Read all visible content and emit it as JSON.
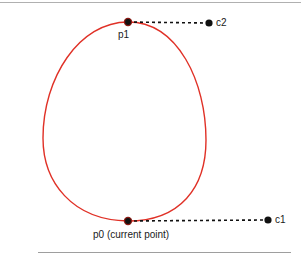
{
  "figure": {
    "background_color": "#ffffff",
    "width": 301,
    "height": 264,
    "rules": {
      "top_rule_color": "#b0b0b0",
      "bottom_rule_color": "#9e9e9e"
    },
    "curve": {
      "name": "closed-bezier-loop",
      "stroke_color": "#e03127",
      "stroke_width": 1.4,
      "fill": "none",
      "path": "M 128 221 C 72 220 43 182 43 138 C 43 78 79 22 128 22 C 178 22 206 82 206 140 C 206 188 180 221 128 221 Z"
    },
    "dashed_lines": {
      "stroke_color": "#111111",
      "stroke_width": 1.6,
      "dash_pattern": "3 3",
      "segments": [
        {
          "name": "p0-to-c1",
          "x1": 128,
          "y1": 221,
          "x2": 266,
          "y2": 220
        },
        {
          "name": "p1-to-c2",
          "x1": 128,
          "y1": 22,
          "x2": 207,
          "y2": 23
        }
      ]
    },
    "points": [
      {
        "id": "p0",
        "label": "p0 (current point)",
        "x": 128,
        "y": 221,
        "color": "#111111",
        "halo_color": "#8a1a14",
        "radius": 3.6
      },
      {
        "id": "p1",
        "label": "p1",
        "x": 128,
        "y": 22,
        "color": "#111111",
        "halo_color": "#8a1a14",
        "radius": 3.6
      },
      {
        "id": "c1",
        "label": "c1",
        "x": 268,
        "y": 220,
        "color": "#111111",
        "halo_color": "#111111",
        "radius": 3.4
      },
      {
        "id": "c2",
        "label": "c2",
        "x": 209,
        "y": 23,
        "color": "#111111",
        "halo_color": "#111111",
        "radius": 3.4
      }
    ],
    "labels": {
      "p0": "p0 (current point)",
      "p1": "p1",
      "c1": "c1",
      "c2": "c2"
    }
  }
}
